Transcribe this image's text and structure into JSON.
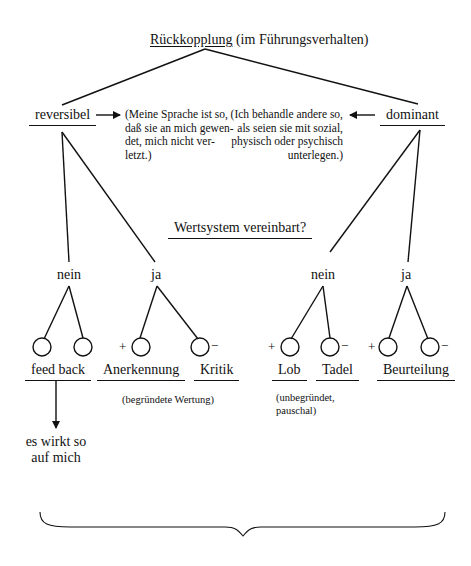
{
  "title": {
    "main": "Rückkopplung",
    "suffix": "(im Führungsverhalten)"
  },
  "branches": {
    "left": {
      "label": "reversibel",
      "note": [
        "(Meine Sprache ist so,",
        "daß sie an mich gewen-",
        "det, mich nicht ver-",
        "letzt.)"
      ]
    },
    "right": {
      "label": "dominant",
      "note": [
        "(Ich behandle andere so,",
        "als seien sie mit sozial,",
        "physisch oder psychisch",
        "unterlegen.)"
      ]
    }
  },
  "question": "Wertsystem vereinbart?",
  "answers": {
    "left_no": "nein",
    "left_yes": "ja",
    "right_no": "nein",
    "right_yes": "ja"
  },
  "signs": {
    "plus": "+",
    "minus": "−"
  },
  "outcomes": {
    "feedback": "feed back",
    "anerkennung": "Anerkennung",
    "kritik": "Kritik",
    "begruendet": "(begründete Wertung)",
    "lob": "Lob",
    "tadel": "Tadel",
    "unbegruendet": [
      "(unbegründet,",
      "pauschal)"
    ],
    "beurteilung": "Beurteilung"
  },
  "effect": [
    "es wirkt so",
    "auf mich"
  ]
}
